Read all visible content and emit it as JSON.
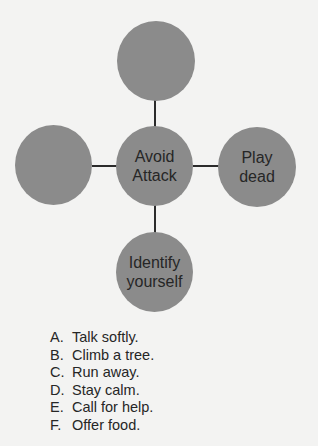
{
  "diagram": {
    "center": {
      "lines": [
        "Avoid",
        "Attack"
      ]
    },
    "top": {
      "lines": []
    },
    "left": {
      "lines": []
    },
    "right": {
      "lines": [
        "Play",
        "dead"
      ]
    },
    "bottom": {
      "lines": [
        "Identify",
        "yourself"
      ]
    },
    "colors": {
      "node_fill": "#8b8b8b",
      "connector": "#2b2b2b",
      "text": "#262626",
      "background": "#f3f3f2"
    }
  },
  "options": [
    {
      "letter": "A.",
      "text": "Talk softly."
    },
    {
      "letter": "B.",
      "text": "Climb a tree."
    },
    {
      "letter": "C.",
      "text": "Run away."
    },
    {
      "letter": "D.",
      "text": "Stay calm."
    },
    {
      "letter": "E.",
      "text": "Call for help."
    },
    {
      "letter": "F.",
      "text": "Offer food."
    }
  ]
}
